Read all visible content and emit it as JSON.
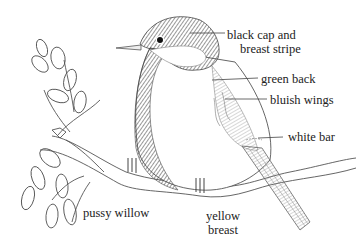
{
  "figure": {
    "labels": {
      "black_cap_line1": "black cap and",
      "black_cap_line2": "breast stripe",
      "green_back": "green back",
      "bluish_wings": "bluish wings",
      "white_bar": "white bar",
      "pussy_willow": "pussy willow",
      "yellow_breast_line1": "yellow",
      "yellow_breast_line2": "breast"
    },
    "colors": {
      "background": "#ffffff",
      "ink": "#333333",
      "text": "#222222"
    }
  }
}
